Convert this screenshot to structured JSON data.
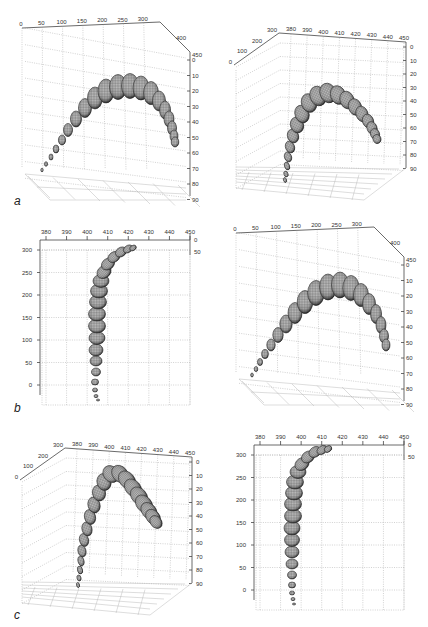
{
  "figure": {
    "panel_labels": [
      "a",
      "b",
      "c"
    ],
    "colors": {
      "axis": "#444444",
      "grid": "#9a9a9a",
      "sphere_dark": "#1e1e1e",
      "sphere_mid": "#6f6f6f",
      "sphere_light": "#c8c8c8"
    }
  },
  "chart_data": [
    {
      "id": "a-left",
      "type": "surface3d",
      "panel": "a",
      "view": "front-oblique",
      "title": "",
      "grid": true,
      "x_ticks": [
        "0",
        "50",
        "100",
        "150",
        "200",
        "250",
        "300"
      ],
      "y_ticks": [
        "400",
        "450"
      ],
      "z_ticks": [
        "0",
        "10",
        "20",
        "30",
        "40",
        "50",
        "60",
        "70",
        "80",
        "90"
      ],
      "description": "Chain of ellipsoids forming an arch, growing from small (left, z~70) to large at apex (x~200, z~20) then descending to right (x~300, z~60)"
    },
    {
      "id": "a-right",
      "type": "surface3d",
      "panel": "a",
      "view": "side-oblique",
      "grid": true,
      "y_ticks": [
        "0",
        "100",
        "200",
        "300"
      ],
      "x_ticks": [
        "380",
        "390",
        "400",
        "410",
        "420",
        "430",
        "440",
        "450"
      ],
      "z_ticks": [
        "0",
        "10",
        "20",
        "30",
        "40",
        "50",
        "60",
        "70",
        "80",
        "90"
      ],
      "description": "Tube rising from bottom (z~90) bending over at apex (z~30) and descending to z~65 on the right"
    },
    {
      "id": "b-left",
      "type": "surface3d",
      "panel": "b",
      "view": "top",
      "grid": true,
      "x_ticks": [
        "380",
        "390",
        "400",
        "410",
        "420",
        "430",
        "440",
        "450"
      ],
      "y_ticks": [
        "0",
        "50",
        "100",
        "150",
        "200",
        "250",
        "300"
      ],
      "z_ticks": [
        "0",
        "50"
      ],
      "description": "Top view: vertical column of ellipsoids at x~405 from y~-20 to y~250, curving right to x~425 at y~300"
    },
    {
      "id": "b-right",
      "type": "surface3d",
      "panel": "b",
      "view": "front-oblique",
      "grid": true,
      "x_ticks": [
        "0",
        "50",
        "100",
        "150",
        "200",
        "250",
        "300"
      ],
      "y_ticks": [
        "400",
        "450"
      ],
      "z_ticks": [
        "0",
        "10",
        "20",
        "30",
        "40",
        "50",
        "60",
        "70",
        "80",
        "90"
      ],
      "description": "Arch of ellipsoids from small at left (z~70) to apex near x~230 (z~10), descending right to z~60"
    },
    {
      "id": "c-left",
      "type": "surface3d",
      "panel": "c",
      "view": "side-oblique",
      "grid": true,
      "y_ticks": [
        "0",
        "100",
        "200",
        "300"
      ],
      "x_ticks": [
        "380",
        "390",
        "400",
        "410",
        "420",
        "430",
        "440",
        "450"
      ],
      "z_ticks": [
        "0",
        "10",
        "20",
        "30",
        "40",
        "50",
        "60",
        "70",
        "80",
        "90"
      ],
      "description": "Mesh tube rising steeply from bottom (z~90), sharp bend at z~20, descending to z~65"
    },
    {
      "id": "c-right",
      "type": "surface3d",
      "panel": "c",
      "view": "top",
      "grid": true,
      "x_ticks": [
        "380",
        "390",
        "400",
        "410",
        "420",
        "430",
        "440",
        "450"
      ],
      "y_ticks": [
        "0",
        "50",
        "100",
        "150",
        "200",
        "250",
        "300"
      ],
      "z_ticks": [
        "0",
        "50"
      ],
      "description": "Top view column at x~407 rising from y~-20 to y~250, curving to x~425 at y~300"
    }
  ]
}
